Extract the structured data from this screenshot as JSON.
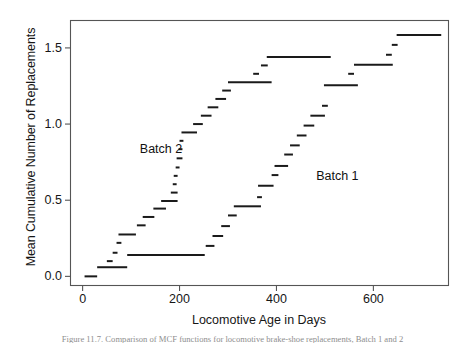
{
  "figure": {
    "background_color": "#ffffff",
    "ink_color": "#1a1a1a",
    "frame_color": "#555555",
    "caption_text": "Figure 11.7.  Comparison of MCF functions for locomotive brake-shoe replacements, Batch 1 and 2"
  },
  "chart_data": {
    "type": "line",
    "title": "",
    "xlabel": "Locomotive Age in Days",
    "ylabel": "Mean Cumulative Number of Replacements",
    "xlim": [
      -25,
      755
    ],
    "ylim": [
      -0.06,
      1.68
    ],
    "xticks": [
      0,
      200,
      400,
      600
    ],
    "xticklabels": [
      "0",
      "200",
      "400",
      "600"
    ],
    "yticks": [
      0.0,
      0.5,
      1.0,
      1.5
    ],
    "yticklabels": [
      "0.0",
      "0.5",
      "1.0",
      "1.5"
    ],
    "grid": false,
    "legend_position": "inline-annotations",
    "marker_style": "horizontal-dash-segments",
    "annotations": [
      {
        "label": "Batch 2",
        "x": 118,
        "y": 0.83
      },
      {
        "label": "Batch 1",
        "x": 482,
        "y": 0.655
      }
    ],
    "series": [
      {
        "name": "Batch 2",
        "points_x": [
          10,
          22,
          24,
          30,
          36,
          44,
          50,
          56,
          64,
          72,
          80,
          92,
          104,
          112,
          122,
          132,
          142,
          152,
          160,
          168,
          176,
          182,
          186,
          190,
          194,
          198,
          202,
          208,
          216,
          226,
          234,
          240,
          248,
          256,
          264,
          272,
          280,
          290,
          300,
          312,
          326,
          340,
          354,
          366,
          376,
          384,
          392
        ],
        "points_y": [
          0.0,
          0.0,
          0.06,
          0.06,
          0.06,
          0.06,
          0.1,
          0.1,
          0.155,
          0.22,
          0.275,
          0.275,
          0.275,
          0.335,
          0.39,
          0.39,
          0.445,
          0.445,
          0.495,
          0.495,
          0.55,
          0.605,
          0.66,
          0.715,
          0.775,
          0.775,
          0.835,
          0.89,
          0.945,
          0.945,
          0.945,
          1.0,
          1.0,
          1.055,
          1.055,
          1.11,
          1.11,
          1.165,
          1.165,
          1.22,
          1.275,
          1.275,
          1.275,
          1.33,
          1.385,
          1.44,
          1.44
        ],
        "step_segments": [
          {
            "y": 0.0,
            "x0": 4,
            "x1": 30
          },
          {
            "y": 0.06,
            "x0": 30,
            "x1": 92
          },
          {
            "y": 0.1,
            "x0": 50,
            "x1": 62
          },
          {
            "y": 0.155,
            "x0": 62,
            "x1": 72
          },
          {
            "y": 0.22,
            "x0": 70,
            "x1": 80
          },
          {
            "y": 0.275,
            "x0": 74,
            "x1": 110
          },
          {
            "y": 0.14,
            "x0": 92,
            "x1": 252
          },
          {
            "y": 0.335,
            "x0": 112,
            "x1": 130
          },
          {
            "y": 0.39,
            "x0": 124,
            "x1": 148
          },
          {
            "y": 0.445,
            "x0": 146,
            "x1": 172
          },
          {
            "y": 0.495,
            "x0": 162,
            "x1": 196
          },
          {
            "y": 0.55,
            "x0": 182,
            "x1": 196
          },
          {
            "y": 0.605,
            "x0": 186,
            "x1": 194
          },
          {
            "y": 0.66,
            "x0": 188,
            "x1": 196
          },
          {
            "y": 0.715,
            "x0": 192,
            "x1": 200
          },
          {
            "y": 0.775,
            "x0": 194,
            "x1": 206
          },
          {
            "y": 0.835,
            "x0": 198,
            "x1": 206
          },
          {
            "y": 0.89,
            "x0": 200,
            "x1": 208
          },
          {
            "y": 0.945,
            "x0": 204,
            "x1": 236
          },
          {
            "y": 1.0,
            "x0": 228,
            "x1": 248
          },
          {
            "y": 1.055,
            "x0": 244,
            "x1": 266
          },
          {
            "y": 1.11,
            "x0": 258,
            "x1": 280
          },
          {
            "y": 1.165,
            "x0": 274,
            "x1": 296
          },
          {
            "y": 1.22,
            "x0": 288,
            "x1": 306
          },
          {
            "y": 1.275,
            "x0": 300,
            "x1": 390
          },
          {
            "y": 1.33,
            "x0": 352,
            "x1": 364
          },
          {
            "y": 1.385,
            "x0": 368,
            "x1": 382
          },
          {
            "y": 1.44,
            "x0": 380,
            "x1": 512
          }
        ]
      },
      {
        "name": "Batch 1",
        "points_x": [
          92,
          252,
          262,
          276,
          290,
          304,
          318,
          336,
          352,
          366,
          374,
          382,
          396,
          404,
          416,
          428,
          440,
          452,
          466,
          480,
          492,
          500,
          512,
          540,
          552,
          588,
          620,
          632,
          644,
          652,
          664,
          690,
          730
        ],
        "points_y": [
          0.14,
          0.14,
          0.2,
          0.265,
          0.33,
          0.4,
          0.46,
          0.46,
          0.52,
          0.595,
          0.595,
          0.665,
          0.725,
          0.725,
          0.8,
          0.86,
          0.925,
          0.99,
          1.055,
          1.055,
          1.12,
          1.255,
          1.255,
          1.255,
          1.39,
          1.39,
          1.455,
          1.52,
          1.585,
          1.585,
          1.585,
          1.585,
          1.585
        ],
        "step_segments": [
          {
            "y": 0.2,
            "x0": 254,
            "x1": 272
          },
          {
            "y": 0.265,
            "x0": 268,
            "x1": 290
          },
          {
            "y": 0.33,
            "x0": 286,
            "x1": 304
          },
          {
            "y": 0.4,
            "x0": 300,
            "x1": 318
          },
          {
            "y": 0.46,
            "x0": 312,
            "x1": 368
          },
          {
            "y": 0.52,
            "x0": 360,
            "x1": 370
          },
          {
            "y": 0.595,
            "x0": 362,
            "x1": 394
          },
          {
            "y": 0.665,
            "x0": 390,
            "x1": 404
          },
          {
            "y": 0.725,
            "x0": 396,
            "x1": 424
          },
          {
            "y": 0.8,
            "x0": 416,
            "x1": 434
          },
          {
            "y": 0.86,
            "x0": 428,
            "x1": 448
          },
          {
            "y": 0.925,
            "x0": 442,
            "x1": 462
          },
          {
            "y": 0.99,
            "x0": 456,
            "x1": 478
          },
          {
            "y": 1.055,
            "x0": 470,
            "x1": 500
          },
          {
            "y": 1.12,
            "x0": 494,
            "x1": 506
          },
          {
            "y": 1.255,
            "x0": 498,
            "x1": 568
          },
          {
            "y": 1.33,
            "x0": 548,
            "x1": 560
          },
          {
            "y": 1.39,
            "x0": 560,
            "x1": 640
          },
          {
            "y": 1.455,
            "x0": 626,
            "x1": 638
          },
          {
            "y": 1.52,
            "x0": 638,
            "x1": 650
          },
          {
            "y": 1.585,
            "x0": 648,
            "x1": 740
          }
        ]
      }
    ]
  }
}
